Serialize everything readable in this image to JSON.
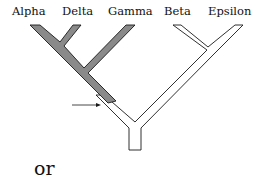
{
  "diagram": {
    "type": "phylogenetic-tree",
    "taxa": [
      {
        "name": "Alpha",
        "x": 12
      },
      {
        "name": "Delta",
        "x": 62
      },
      {
        "name": "Gamma",
        "x": 108
      },
      {
        "name": "Beta",
        "x": 164
      },
      {
        "name": "Epsilon",
        "x": 208
      }
    ],
    "shaded_clade": [
      "Alpha",
      "Delta",
      "Gamma"
    ],
    "colors": {
      "shaded": "#8a8a8a",
      "outline": "#1a1a1a",
      "unshaded": "#ffffff"
    },
    "caption": "or"
  }
}
